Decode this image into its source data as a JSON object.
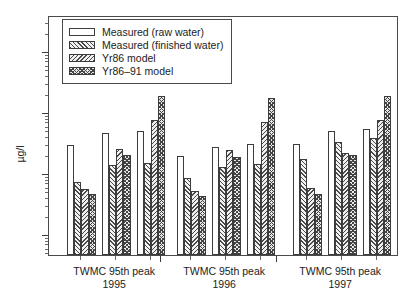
{
  "chart_data": {
    "type": "bar",
    "title": "",
    "subtitle": "",
    "xlabel": "",
    "ylabel": "µg/l",
    "yscale": "log",
    "ylim": [
      0.055,
      300
    ],
    "grid": false,
    "legend_position": "top-left",
    "y_tick_labels": [
      "100",
      "10",
      "1",
      "0.1"
    ],
    "y_tick_values": [
      100,
      10,
      1,
      0.1
    ],
    "categories": [
      "TWMC 95th peak 1995",
      "TWMC 95th peak 1996",
      "TWMC 95th peak 1997"
    ],
    "group_labels": [
      {
        "name": "TWMC 95th peak",
        "year": "1995"
      },
      {
        "name": "TWMC 95th peak",
        "year": "1996"
      },
      {
        "name": "TWMC 95th peak",
        "year": "1997"
      }
    ],
    "subgroups_per_group": 3,
    "series": [
      {
        "name": "Measured (raw water)",
        "pattern": "solid-white",
        "values": [
          [
            2.9,
            4.5,
            4.8
          ],
          [
            1.9,
            2.7,
            3.0
          ],
          [
            3.0,
            4.8,
            5.2
          ]
        ]
      },
      {
        "name": "Measured (finished water)",
        "pattern": "diagonal-hatch-forward",
        "values": [
          [
            0.72,
            1.35,
            1.45
          ],
          [
            0.82,
            1.25,
            1.4
          ],
          [
            1.7,
            3.2,
            3.8
          ]
        ]
      },
      {
        "name": "Yr86 model",
        "pattern": "diagonal-hatch-backward",
        "values": [
          [
            0.55,
            2.5,
            7.3
          ],
          [
            0.5,
            2.4,
            6.8
          ],
          [
            0.57,
            2.1,
            7.4
          ]
        ]
      },
      {
        "name": "Yr86–91 model",
        "pattern": "crosshatch",
        "values": [
          [
            0.45,
            1.95,
            18.0
          ],
          [
            0.42,
            1.85,
            17.0
          ],
          [
            0.46,
            1.95,
            18.5
          ]
        ]
      }
    ]
  },
  "legend": {
    "items": [
      {
        "label": "Measured (raw water)"
      },
      {
        "label": "Measured (finished water)"
      },
      {
        "label": "Yr86 model"
      },
      {
        "label": "Yr86–91 model"
      }
    ]
  }
}
